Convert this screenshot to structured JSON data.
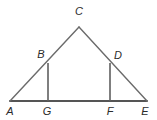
{
  "figure": {
    "type": "geometry-diagram",
    "background_color": "#ffffff",
    "stroke_color_base": "#555555",
    "stroke_color_sides": "#6b6b6b",
    "label_color": "#2b2b2b",
    "canvas": {
      "width": 157,
      "height": 120
    },
    "points": [
      {
        "name": "A",
        "label": "A",
        "x": 10,
        "y": 101,
        "label_x": 10,
        "label_y": 111
      },
      {
        "name": "G",
        "label": "G",
        "x": 48,
        "y": 101,
        "label_x": 47,
        "label_y": 111
      },
      {
        "name": "F",
        "label": "F",
        "x": 110,
        "y": 101,
        "label_x": 110,
        "label_y": 111
      },
      {
        "name": "E",
        "label": "E",
        "x": 147,
        "y": 101,
        "label_x": 145,
        "label_y": 111
      },
      {
        "name": "B",
        "label": "B",
        "x": 48,
        "y": 63,
        "label_x": 41,
        "label_y": 54
      },
      {
        "name": "D",
        "label": "D",
        "x": 110,
        "y": 63,
        "label_x": 118,
        "label_y": 55
      },
      {
        "name": "C",
        "label": "C",
        "x": 79,
        "y": 27,
        "label_x": 79,
        "label_y": 11
      }
    ],
    "segments": [
      {
        "name": "segment-AE",
        "from": "A",
        "to": "E",
        "role": "base",
        "x1": 10,
        "y1": 101,
        "x2": 147,
        "y2": 101,
        "width": 2.0,
        "color": "#555555"
      },
      {
        "name": "segment-AC",
        "from": "A",
        "to": "C",
        "role": "left-side",
        "x1": 10,
        "y1": 101,
        "x2": 79,
        "y2": 27,
        "width": 1.4,
        "color": "#6b6b6b"
      },
      {
        "name": "segment-CE",
        "from": "C",
        "to": "E",
        "role": "right-side",
        "x1": 79,
        "y1": 27,
        "x2": 147,
        "y2": 101,
        "width": 1.4,
        "color": "#6b6b6b"
      },
      {
        "name": "segment-BG",
        "from": "B",
        "to": "G",
        "role": "left-altitude",
        "x1": 48,
        "y1": 63,
        "x2": 48,
        "y2": 101,
        "width": 1.6,
        "color": "#5f5f5f"
      },
      {
        "name": "segment-DF",
        "from": "D",
        "to": "F",
        "role": "right-altitude",
        "x1": 110,
        "y1": 63,
        "x2": 110,
        "y2": 101,
        "width": 1.6,
        "color": "#5f5f5f"
      }
    ]
  }
}
